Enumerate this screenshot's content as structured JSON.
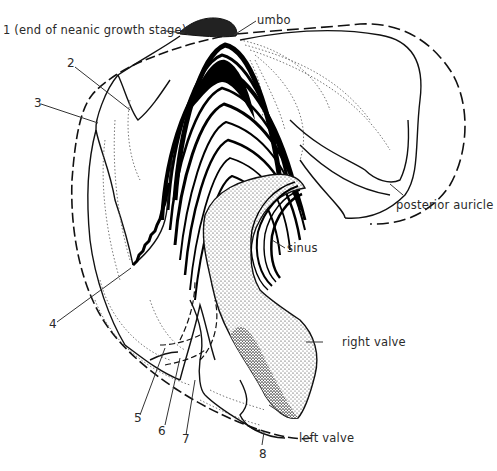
{
  "figure": {
    "labels": {
      "l1": "1 (end of neanic growth stage)",
      "umbo": "umbo",
      "l2": "2",
      "l3": "3",
      "posterior_auricle": "posterior auricle",
      "sinus": "sinus",
      "l4": "4",
      "right_valve": "right valve",
      "l5": "5",
      "l6": "6",
      "l7": "7",
      "left_valve": "left valve",
      "l8": "8"
    },
    "colors": {
      "ink": "#111111",
      "label_text": "#2a2a2a",
      "dotted_lines": "#555555",
      "background": "#ffffff"
    }
  }
}
